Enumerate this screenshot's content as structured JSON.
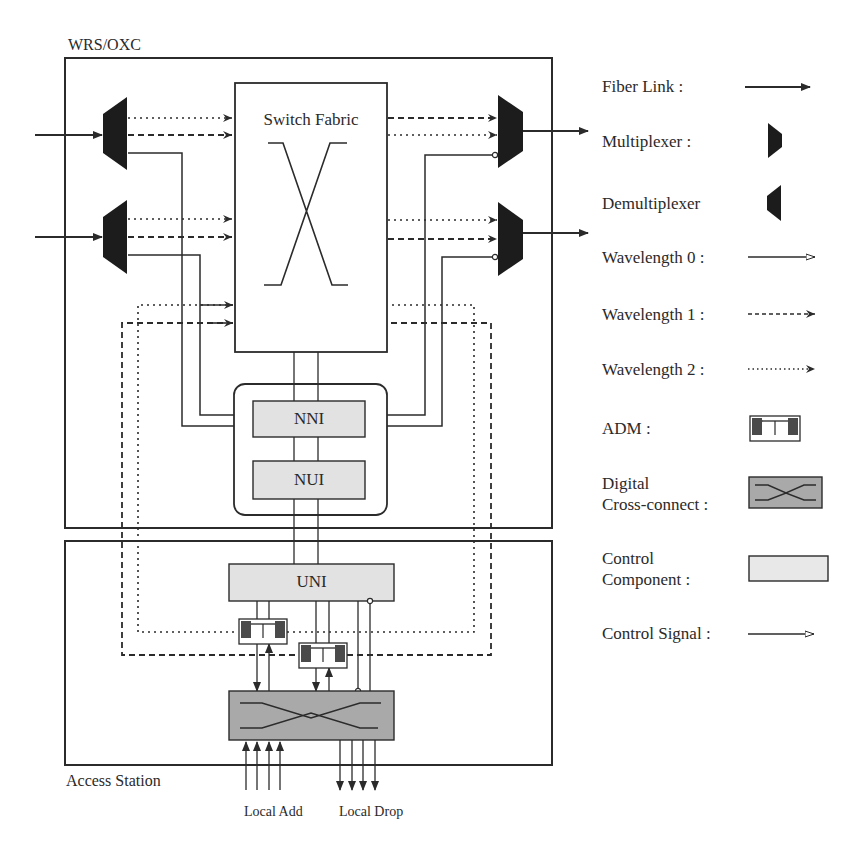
{
  "diagram": {
    "title": "WRS/OXC",
    "access_station_label": "Access Station",
    "switch_fabric_label": "Switch Fabric",
    "nni_label": "NNI",
    "nui_label": "NUI",
    "uni_label": "UNI",
    "local_add_label": "Local Add",
    "local_drop_label": "Local Drop"
  },
  "legend": {
    "items": [
      {
        "label": "Fiber Link :",
        "icon": "fiber-link-arrow"
      },
      {
        "label": "Multiplexer :",
        "icon": "multiplexer-shape"
      },
      {
        "label": "Demultiplexer",
        "icon": "demultiplexer-shape"
      },
      {
        "label": "Wavelength 0 :",
        "icon": "solid-arrow-open-head"
      },
      {
        "label": "Wavelength 1 :",
        "icon": "dashed-arrow"
      },
      {
        "label": "Wavelength 2 :",
        "icon": "dotted-arrow"
      },
      {
        "label": "ADM :",
        "icon": "adm-box"
      },
      {
        "label": "Digital\nCross-connect :",
        "icon": "cross-connect-box"
      },
      {
        "label": "Control\nComponent :",
        "icon": "control-component-box"
      },
      {
        "label": "Control Signal :",
        "icon": "control-signal-arrow"
      }
    ]
  },
  "colors": {
    "line": "#2b2b2b",
    "mux_fill": "#1c1c1c",
    "control_fill": "#e2e2e2",
    "crossconnect_fill": "#a9a9a9",
    "adm_dark": "#4a4a4a"
  }
}
